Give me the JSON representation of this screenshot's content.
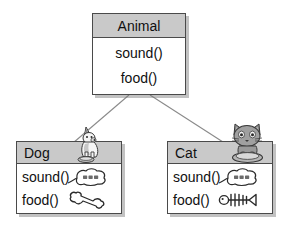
{
  "diagram": {
    "type": "uml-class-diagram",
    "background_color": "#ffffff",
    "header_fill": "#c9c9c9",
    "body_fill": "#ffffff",
    "border_color": "#4a4a4a",
    "shadow_color": "#999999"
  },
  "classes": {
    "animal": {
      "name": "Animal",
      "role": "superclass",
      "methods": [
        {
          "label": "sound()"
        },
        {
          "label": "food()"
        }
      ]
    },
    "dog": {
      "name": "Dog",
      "role": "subclass",
      "artwork": "dog-sitting-with-bowl-image",
      "methods": [
        {
          "label": "sound()",
          "icon": "speech-bubble-bark-icon",
          "icon_text": "멍멍멍"
        },
        {
          "label": "food()",
          "icon": "bone-icon"
        }
      ]
    },
    "cat": {
      "name": "Cat",
      "role": "subclass",
      "artwork": "cat-sitting-in-bowl-image",
      "methods": [
        {
          "label": "sound()",
          "icon": "speech-bubble-meow-icon",
          "icon_text": "야옹옹"
        },
        {
          "label": "food()",
          "icon": "fish-bone-icon"
        }
      ]
    }
  },
  "relationships": [
    {
      "from": "Animal",
      "to": "Dog",
      "kind": "inheritance"
    },
    {
      "from": "Animal",
      "to": "Cat",
      "kind": "inheritance"
    }
  ]
}
